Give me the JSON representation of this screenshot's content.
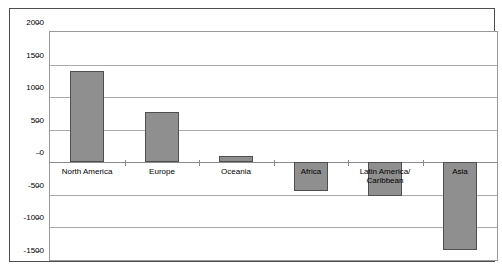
{
  "chart_data": {
    "type": "bar",
    "title": "",
    "categories": [
      "North America",
      "Europe",
      "Oceania",
      "Africa",
      "Latin America/\nCaribbean",
      "Asia"
    ],
    "values": [
      1400,
      770,
      90,
      -450,
      -520,
      -1350
    ],
    "xlabel": "",
    "ylabel": "",
    "ylim": [
      -1500,
      2000
    ],
    "yticks": [
      2000,
      1500,
      1000,
      500,
      0,
      -500,
      -1000,
      -1500
    ],
    "grid": true,
    "legend": false,
    "colors": {
      "bar_fill": "#8f8f8f",
      "bar_border": "#4f4f4f",
      "gridline": "#ababab",
      "zero_axis": "#8a8a8a",
      "frame_border": "#4d4d4d",
      "plot_border": "#999999",
      "background": "#ffffff",
      "text": "#000000"
    }
  }
}
